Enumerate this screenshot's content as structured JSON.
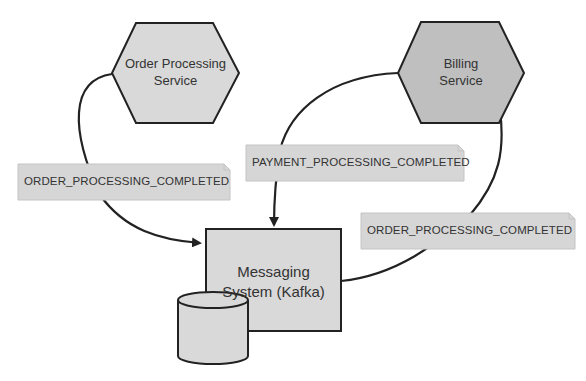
{
  "diagram": {
    "nodes": {
      "order_service": {
        "line1": "Order Processing",
        "line2": "Service",
        "shape": "hexagon",
        "fill": "#d9d9d9"
      },
      "billing_service": {
        "line1": "Billing",
        "line2": "Service",
        "shape": "hexagon",
        "fill": "#bfbfbf"
      },
      "messaging": {
        "line1": "Messaging",
        "line2": "System (Kafka)",
        "shape": "rectangle",
        "fill": "#d9d9d9"
      },
      "storage": {
        "shape": "cylinder",
        "fill": "#d9d9d9"
      }
    },
    "notes": {
      "left_event": "ORDER_PROCESSING_COMPLETED",
      "middle_event": "PAYMENT_PROCESSING_COMPLETED",
      "right_event": "ORDER_PROCESSING_COMPLETED"
    },
    "edges": [
      {
        "from": "order_service",
        "to": "messaging",
        "label": "ORDER_PROCESSING_COMPLETED"
      },
      {
        "from": "billing_service",
        "to": "messaging",
        "label": "PAYMENT_PROCESSING_COMPLETED"
      },
      {
        "from": "messaging",
        "to": "billing_service",
        "label": "ORDER_PROCESSING_COMPLETED"
      }
    ],
    "colors": {
      "stroke": "#222222",
      "note_fill": "#d6d6d6",
      "note_border": "#c4c4c4"
    }
  }
}
